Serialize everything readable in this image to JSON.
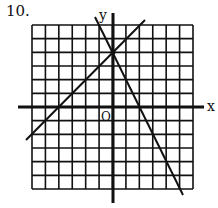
{
  "problem_number": "10.",
  "axes": {
    "x_label": "x",
    "y_label": "y",
    "origin_label": "O"
  },
  "grid": {
    "cells_x": 12,
    "cells_y": 12,
    "x_range": [
      -6,
      6
    ],
    "y_range": [
      -6,
      6
    ]
  },
  "lines": [
    {
      "name": "line-positive-slope",
      "equation": "y = x + 4",
      "x_intercept": -4,
      "y_intercept": 4
    },
    {
      "name": "line-negative-slope",
      "equation": "y = -2x + 4",
      "x_intercept": 2,
      "y_intercept": 4
    }
  ],
  "intersection": {
    "x": 0,
    "y": 4
  },
  "colors": {
    "ink": "#111111",
    "background": "#ffffff"
  }
}
